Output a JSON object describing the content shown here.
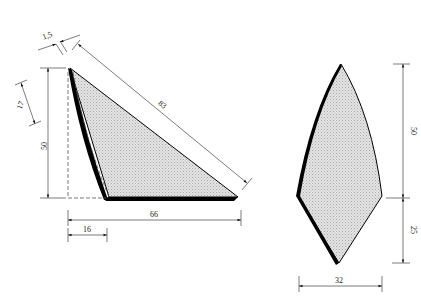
{
  "diagram": {
    "title": "",
    "colors": {
      "outline": "#000000",
      "fill": "#d6d6d6",
      "dimension_line": "#444444",
      "hidden_line": "#555555",
      "background": "#ffffff"
    },
    "left_figure": {
      "name": "triangular-profile",
      "dimensions": {
        "thickness": "1,5",
        "hypotenuse": "83",
        "height": "50",
        "upper_segment": "17",
        "base_width": "66",
        "base_offset": "16"
      }
    },
    "right_figure": {
      "name": "pointed-profile",
      "dimensions": {
        "upper_height": "50",
        "lower_height": "25",
        "width": "32"
      }
    }
  }
}
